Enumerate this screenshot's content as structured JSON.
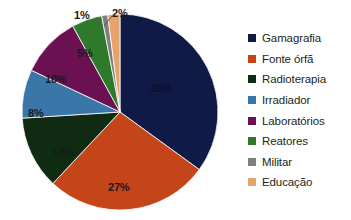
{
  "chart_data": {
    "type": "pie",
    "title": "",
    "subtitle": "",
    "xlabel": "",
    "ylabel": "",
    "grid": false,
    "legend_position": "right",
    "value_unit": "%",
    "categories": [
      "Gamagrafia",
      "Fonte órfã",
      "Radioterapia",
      "Irradiador",
      "Laboratórios",
      "Reatores",
      "Militar",
      "Educação"
    ],
    "values": [
      35,
      27,
      12,
      8,
      10,
      5,
      1,
      2
    ],
    "labels": [
      "35%",
      "27%",
      "12%",
      "8%",
      "10%",
      "5%",
      "1%",
      "2%"
    ],
    "colors": [
      "#101a46",
      "#c4451a",
      "#0f2b12",
      "#3a77a8",
      "#6b1050",
      "#2f7a2a",
      "#7d7f83",
      "#e8a36a"
    ],
    "slices": [
      {
        "name": "Gamagrafia",
        "value": 35,
        "label": "35%",
        "color": "#101a46",
        "label_x": 150,
        "label_y": 83,
        "label_style": "on-dark"
      },
      {
        "name": "Fonte órfã",
        "value": 27,
        "label": "27%",
        "color": "#c4451a",
        "label_x": 108,
        "label_y": 182,
        "label_style": "dark"
      },
      {
        "name": "Radioterapia",
        "value": 12,
        "label": "12%",
        "color": "#0f2b12",
        "label_x": 52,
        "label_y": 147,
        "label_style": "dark"
      },
      {
        "name": "Irradiador",
        "value": 8,
        "label": "8%",
        "color": "#3a77a8",
        "label_x": 28,
        "label_y": 108,
        "label_style": "dark"
      },
      {
        "name": "Laboratórios",
        "value": 10,
        "label": "10%",
        "color": "#6b1050",
        "label_x": 45,
        "label_y": 74,
        "label_style": "dark"
      },
      {
        "name": "Reatores",
        "value": 5,
        "label": "5%",
        "color": "#2f7a2a",
        "label_x": 77,
        "label_y": 48,
        "label_style": "dark"
      },
      {
        "name": "Militar",
        "value": 1,
        "label": "1%",
        "color": "#7d7f83",
        "label_x": 74,
        "label_y": 10,
        "label_style": "dark"
      },
      {
        "name": "Educação",
        "value": 2,
        "label": "2%",
        "color": "#e8a36a",
        "label_x": 112,
        "label_y": 8,
        "label_style": "dark"
      }
    ]
  },
  "legend": {
    "items": [
      {
        "label": "Gamagrafia",
        "color": "#101a46"
      },
      {
        "label": "Fonte órfã",
        "color": "#c4451a"
      },
      {
        "label": "Radioterapia",
        "color": "#0f2b12"
      },
      {
        "label": "Irradiador",
        "color": "#3a77a8"
      },
      {
        "label": "Laboratórios",
        "color": "#6b1050"
      },
      {
        "label": "Reatores",
        "color": "#2f7a2a"
      },
      {
        "label": "Militar",
        "color": "#7d7f83"
      },
      {
        "label": "Educação",
        "color": "#e8a36a"
      }
    ]
  }
}
